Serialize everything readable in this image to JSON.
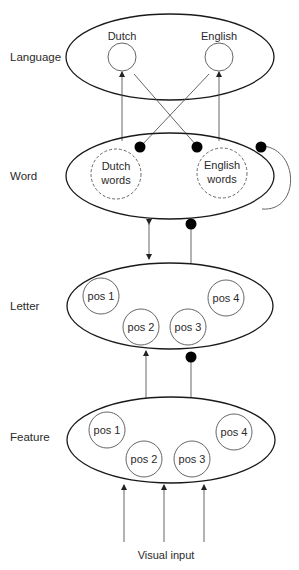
{
  "diagram": {
    "type": "layered network (BIA model)",
    "layers": [
      {
        "id": "language",
        "label": "Language",
        "nodes": [
          "Dutch",
          "English"
        ]
      },
      {
        "id": "word",
        "label": "Word",
        "nodes": [
          {
            "line1": "Dutch",
            "line2": "words"
          },
          {
            "line1": "English",
            "line2": "words"
          }
        ]
      },
      {
        "id": "letter",
        "label": "Letter",
        "nodes": [
          "pos 1",
          "pos 2",
          "pos 3",
          "pos 4"
        ]
      },
      {
        "id": "feature",
        "label": "Feature",
        "nodes": [
          "pos 1",
          "pos 2",
          "pos 3",
          "pos 4"
        ]
      }
    ],
    "input_label": "Visual input",
    "connections": [
      {
        "from": "Dutch words",
        "to": "Dutch (language)",
        "type": "excitatory"
      },
      {
        "from": "English words",
        "to": "English (language)",
        "type": "excitatory"
      },
      {
        "from": "Dutch (language)",
        "to": "English words",
        "type": "inhibitory"
      },
      {
        "from": "English (language)",
        "to": "Dutch words",
        "type": "inhibitory"
      },
      {
        "from": "Word",
        "to": "Word",
        "type": "inhibitory (lateral)"
      },
      {
        "from": "Word",
        "to": "Letter",
        "type": "bidirectional excitatory"
      },
      {
        "from": "Letter",
        "to": "Word",
        "type": "inhibitory"
      },
      {
        "from": "Feature",
        "to": "Letter",
        "type": "excitatory"
      },
      {
        "from": "Feature",
        "to": "Letter",
        "type": "inhibitory"
      },
      {
        "from": "Visual input",
        "to": "Feature",
        "type": "excitatory",
        "count": 3
      }
    ]
  }
}
